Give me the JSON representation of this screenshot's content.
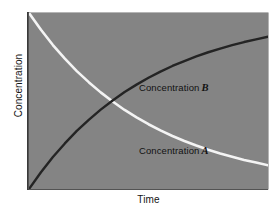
{
  "chart_data": {
    "type": "line",
    "title": "",
    "xlabel": "Time",
    "ylabel": "Concentration",
    "xlim": [
      0,
      1
    ],
    "ylim": [
      0,
      1
    ],
    "grid": false,
    "legend_position": "inline-annotation",
    "plot_background": "#848484",
    "figure_background": "#ffffff",
    "axis_color": "#3a3a3a",
    "annotations": [
      {
        "text": "Concentration",
        "symbol": "B",
        "x": 0.34,
        "y": 0.67
      },
      {
        "text": "Concentration",
        "symbol": "A",
        "x": 0.34,
        "y": 0.32
      }
    ],
    "series": [
      {
        "name": "Concentration A",
        "symbol": "A",
        "color": "#f4f4f4",
        "shape": "exponential-decay",
        "linewidth": 2.6,
        "x": [
          0.0,
          0.05,
          0.1,
          0.15,
          0.2,
          0.25,
          0.3,
          0.35,
          0.4,
          0.45,
          0.5,
          0.55,
          0.6,
          0.65,
          0.7,
          0.75,
          0.8,
          0.85,
          0.9,
          0.95,
          1.0
        ],
        "y": [
          1.0,
          0.905,
          0.818,
          0.741,
          0.67,
          0.607,
          0.549,
          0.497,
          0.449,
          0.407,
          0.368,
          0.333,
          0.301,
          0.273,
          0.247,
          0.223,
          0.202,
          0.183,
          0.165,
          0.15,
          0.135
        ]
      },
      {
        "name": "Concentration B",
        "symbol": "B",
        "color": "#242424",
        "shape": "exponential-rise",
        "linewidth": 2.4,
        "x": [
          0.0,
          0.05,
          0.1,
          0.15,
          0.2,
          0.25,
          0.3,
          0.35,
          0.4,
          0.45,
          0.5,
          0.55,
          0.6,
          0.65,
          0.7,
          0.75,
          0.8,
          0.85,
          0.9,
          0.95,
          1.0
        ],
        "y": [
          0.0,
          0.095,
          0.182,
          0.259,
          0.33,
          0.393,
          0.451,
          0.503,
          0.551,
          0.593,
          0.632,
          0.667,
          0.699,
          0.727,
          0.753,
          0.777,
          0.798,
          0.817,
          0.835,
          0.85,
          0.865
        ]
      }
    ],
    "crossing_point": {
      "x": 0.185,
      "y": 0.5
    }
  },
  "axes": {
    "y_title": "Concentration",
    "x_title": "Time"
  },
  "labels": {
    "concentration_b_text": "Concentration",
    "concentration_b_symbol": "B",
    "concentration_a_text": "Concentration",
    "concentration_a_symbol": "A"
  }
}
